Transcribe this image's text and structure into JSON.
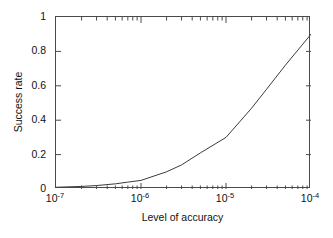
{
  "chart_data": {
    "type": "line",
    "title": "",
    "xlabel": "Level of accuracy",
    "ylabel": "Success rate",
    "xscale": "log",
    "yscale": "linear",
    "xlim": [
      1e-07,
      0.0001
    ],
    "ylim": [
      0,
      1
    ],
    "grid": false,
    "legend": null,
    "xticks": [
      1e-07,
      1e-06,
      1e-05,
      0.0001
    ],
    "xtick_labels": [
      "10-7",
      "10-6",
      "10-5",
      "10-4"
    ],
    "xtick_mantissa": [
      "10",
      "10",
      "10",
      "10"
    ],
    "xtick_exponents": [
      "-7",
      "-6",
      "-5",
      "-4"
    ],
    "yticks": [
      0,
      0.2,
      0.4,
      0.6,
      0.8,
      1
    ],
    "ytick_labels": [
      "0",
      "0.2",
      "0.4",
      "0.6",
      "0.8",
      "1"
    ],
    "minor_xticks": true,
    "line_color": "#3c3c3c",
    "line_width": 1,
    "series": [
      {
        "name": "success rate",
        "x": [
          1e-07,
          2e-07,
          3e-07,
          5e-07,
          7e-07,
          1e-06,
          2e-06,
          3e-06,
          5e-06,
          1e-05,
          2e-05,
          3e-05,
          5e-05,
          0.0001
        ],
        "y": [
          0.01,
          0.015,
          0.02,
          0.03,
          0.04,
          0.05,
          0.1,
          0.14,
          0.21,
          0.3,
          0.47,
          0.58,
          0.72,
          0.9
        ]
      }
    ],
    "annotations": [
      "curve is nearly flat from 1e-7 to 1e-6 (0.01 to 0.05)",
      "inflection (knee) at 1e-6",
      "second slope change at 1e-5 where success rate is 0.30",
      "endpoint at 1e-4 with success rate 0.90"
    ]
  },
  "axes": {
    "x_title": "Level of accuracy",
    "y_title": "Success rate"
  },
  "colors": {
    "background": "#ffffff",
    "axis": "#4a4a4a",
    "text": "#111111",
    "line": "#3c3c3c"
  }
}
